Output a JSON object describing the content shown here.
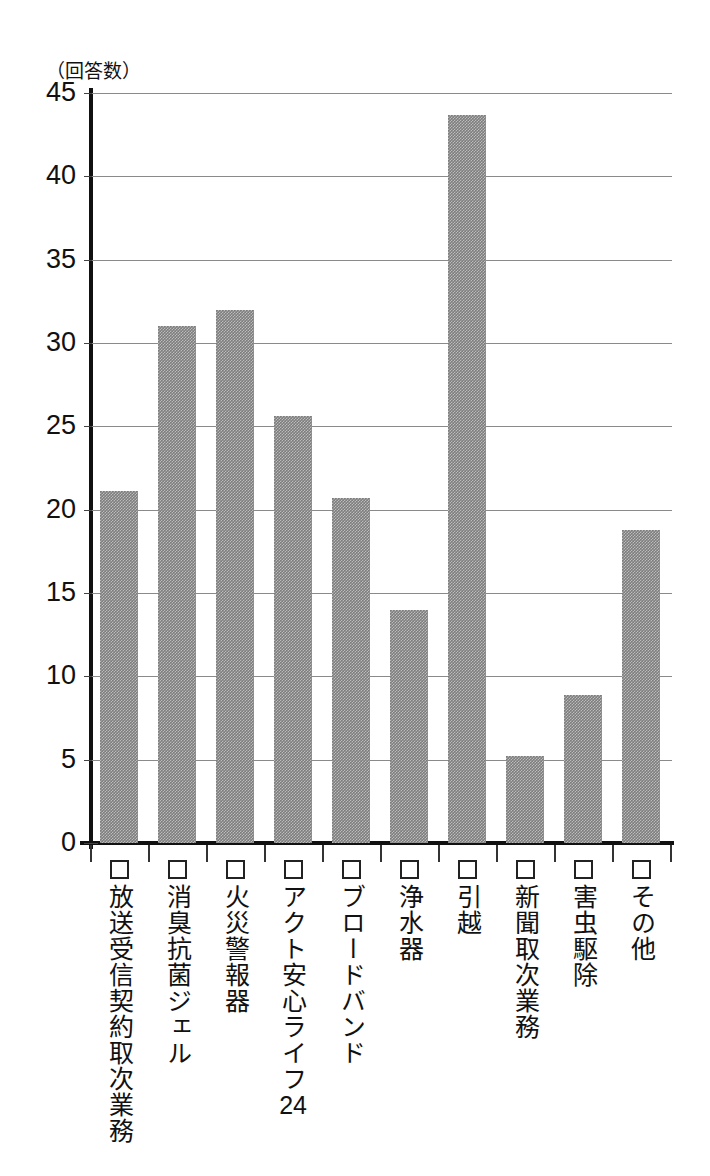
{
  "chart_data": {
    "type": "bar",
    "title": "",
    "subtitle": "",
    "xlabel": "",
    "ylabel": "（回答数）",
    "ylim": [
      0,
      45
    ],
    "ytick_step": 5,
    "yticks": [
      "45",
      "40",
      "35",
      "30",
      "25",
      "20",
      "15",
      "10",
      "5",
      "0"
    ],
    "grid": true,
    "legend": "none",
    "bar_color": "#7d7d7d",
    "axis_color": "#111111",
    "gridline_color": "#8a8a8a",
    "categories": [
      "放送受信契約取次業務",
      "消臭抗菌ジェル",
      "火災警報器",
      "アクト安心ライフ24",
      "ブロードバンド",
      "浄水器",
      "引越",
      "新聞取次業務",
      "害虫駆除",
      "その他"
    ],
    "category_prefix_icon": "checkbox-empty-icon",
    "values": [
      21.1,
      31.0,
      32.0,
      25.6,
      20.7,
      14.0,
      43.7,
      5.2,
      8.9,
      18.8
    ]
  }
}
